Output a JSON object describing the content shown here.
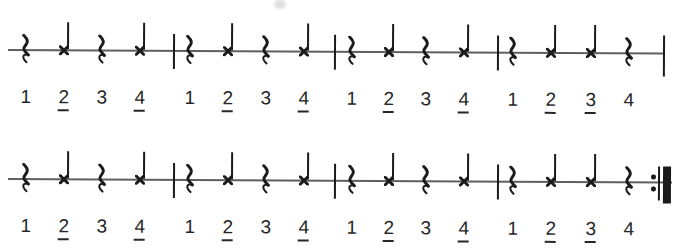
{
  "page": {
    "background": "#ffffff"
  },
  "ink": {
    "symbol_color": "#1b1b1b",
    "staff_color": "#5f5f5f",
    "number_color": "#262626"
  },
  "notation": {
    "systems": [
      {
        "label": "system-1",
        "end_barline": "thin",
        "measures": [
          {
            "beats": [
              {
                "count": "1",
                "symbol": "quarter-rest",
                "underlined": false
              },
              {
                "count": "2",
                "symbol": "x-note",
                "underlined": true
              },
              {
                "count": "3",
                "symbol": "quarter-rest",
                "underlined": false
              },
              {
                "count": "4",
                "symbol": "x-note",
                "underlined": true
              }
            ]
          },
          {
            "beats": [
              {
                "count": "1",
                "symbol": "quarter-rest",
                "underlined": false
              },
              {
                "count": "2",
                "symbol": "x-note",
                "underlined": true
              },
              {
                "count": "3",
                "symbol": "quarter-rest",
                "underlined": false
              },
              {
                "count": "4",
                "symbol": "x-note",
                "underlined": true
              }
            ]
          },
          {
            "beats": [
              {
                "count": "1",
                "symbol": "quarter-rest",
                "underlined": false
              },
              {
                "count": "2",
                "symbol": "x-note",
                "underlined": true
              },
              {
                "count": "3",
                "symbol": "quarter-rest",
                "underlined": false
              },
              {
                "count": "4",
                "symbol": "x-note",
                "underlined": true
              }
            ]
          },
          {
            "beats": [
              {
                "count": "1",
                "symbol": "quarter-rest",
                "underlined": false
              },
              {
                "count": "2",
                "symbol": "x-note",
                "underlined": true
              },
              {
                "count": "3",
                "symbol": "x-note",
                "underlined": true
              },
              {
                "count": "4",
                "symbol": "quarter-rest",
                "underlined": false
              }
            ]
          }
        ]
      },
      {
        "label": "system-2",
        "end_barline": "final-repeat",
        "measures": [
          {
            "beats": [
              {
                "count": "1",
                "symbol": "quarter-rest",
                "underlined": false
              },
              {
                "count": "2",
                "symbol": "x-note",
                "underlined": true
              },
              {
                "count": "3",
                "symbol": "quarter-rest",
                "underlined": false
              },
              {
                "count": "4",
                "symbol": "x-note",
                "underlined": true
              }
            ]
          },
          {
            "beats": [
              {
                "count": "1",
                "symbol": "quarter-rest",
                "underlined": false
              },
              {
                "count": "2",
                "symbol": "x-note",
                "underlined": true
              },
              {
                "count": "3",
                "symbol": "quarter-rest",
                "underlined": false
              },
              {
                "count": "4",
                "symbol": "x-note",
                "underlined": true
              }
            ]
          },
          {
            "beats": [
              {
                "count": "1",
                "symbol": "quarter-rest",
                "underlined": false
              },
              {
                "count": "2",
                "symbol": "x-note",
                "underlined": true
              },
              {
                "count": "3",
                "symbol": "quarter-rest",
                "underlined": false
              },
              {
                "count": "4",
                "symbol": "x-note",
                "underlined": true
              }
            ]
          },
          {
            "beats": [
              {
                "count": "1",
                "symbol": "quarter-rest",
                "underlined": false
              },
              {
                "count": "2",
                "symbol": "x-note",
                "underlined": true
              },
              {
                "count": "3",
                "symbol": "x-note",
                "underlined": true
              },
              {
                "count": "4",
                "symbol": "quarter-rest",
                "underlined": false
              }
            ]
          }
        ]
      }
    ]
  }
}
